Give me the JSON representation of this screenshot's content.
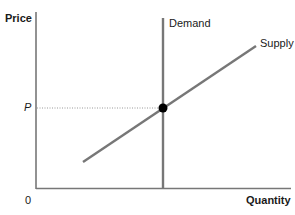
{
  "diagram": {
    "type": "supply-demand",
    "y_axis_label": "Price",
    "x_axis_label": "Quantity",
    "origin_label": "0",
    "price_marker_label": "P",
    "curves": [
      {
        "name": "Demand",
        "label": "Demand",
        "shape": "vertical line",
        "color": "#777777"
      },
      {
        "name": "Supply",
        "label": "Supply",
        "shape": "upward-sloping line",
        "color": "#777777"
      }
    ],
    "equilibrium_point": {
      "label": "P",
      "color": "#000000"
    },
    "guide_line": {
      "style": "dotted",
      "from": "P on price axis",
      "to": "equilibrium point"
    },
    "colors": {
      "axis": "#777777",
      "curve": "#777777",
      "dot": "#000000",
      "text": "#1a1a1a"
    }
  }
}
